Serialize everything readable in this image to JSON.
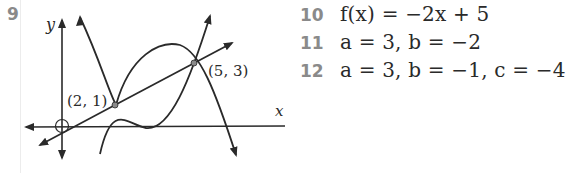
{
  "answers": [
    {
      "number": "9",
      "type": "graph"
    },
    {
      "number": "10",
      "text": "f(x) = −2x + 5"
    },
    {
      "number": "11",
      "text": "a = 3,  b = −2"
    },
    {
      "number": "12",
      "text": "a = 3,  b = −1,  c = −4"
    }
  ],
  "graph": {
    "x_axis_label": "x",
    "y_axis_label": "y",
    "points": [
      {
        "label": "(2, 1)",
        "x": 2,
        "y": 1
      },
      {
        "label": "(5, 3)",
        "x": 5,
        "y": 3
      }
    ],
    "curves": [
      "line through (2,1) and (5,3)",
      "downward parabola",
      "upward parabola"
    ],
    "colors": {
      "ink": "#2a2a2a",
      "point": "#8a8a8a",
      "question_number": "#8a8a8a"
    }
  }
}
